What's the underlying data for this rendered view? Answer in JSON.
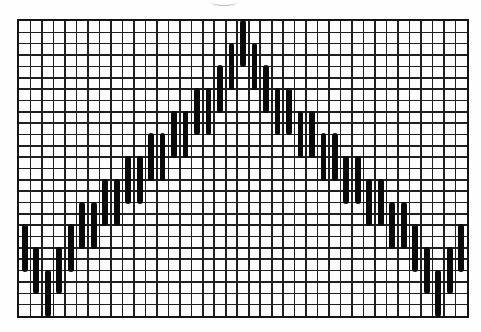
{
  "figure": {
    "name": "bargello-flame-stitch-chart",
    "grid": {
      "columns": 39,
      "rows": 26
    },
    "stitch": {
      "span_rows": 4,
      "step_rows": 2
    },
    "stitches": [
      {
        "col": 1,
        "row": 19
      },
      {
        "col": 2,
        "row": 21
      },
      {
        "col": 3,
        "row": 23
      },
      {
        "col": 4,
        "row": 21
      },
      {
        "col": 5,
        "row": 19
      },
      {
        "col": 6,
        "row": 17
      },
      {
        "col": 7,
        "row": 17
      },
      {
        "col": 8,
        "row": 15
      },
      {
        "col": 9,
        "row": 15
      },
      {
        "col": 10,
        "row": 13
      },
      {
        "col": 11,
        "row": 13
      },
      {
        "col": 12,
        "row": 11
      },
      {
        "col": 13,
        "row": 11
      },
      {
        "col": 14,
        "row": 9
      },
      {
        "col": 15,
        "row": 9
      },
      {
        "col": 16,
        "row": 7
      },
      {
        "col": 17,
        "row": 7
      },
      {
        "col": 18,
        "row": 5
      },
      {
        "col": 19,
        "row": 3
      },
      {
        "col": 20,
        "row": 1
      },
      {
        "col": 21,
        "row": 3
      },
      {
        "col": 22,
        "row": 5
      },
      {
        "col": 23,
        "row": 7
      },
      {
        "col": 24,
        "row": 7
      },
      {
        "col": 25,
        "row": 9
      },
      {
        "col": 26,
        "row": 9
      },
      {
        "col": 27,
        "row": 11
      },
      {
        "col": 28,
        "row": 11
      },
      {
        "col": 29,
        "row": 13
      },
      {
        "col": 30,
        "row": 13
      },
      {
        "col": 31,
        "row": 15
      },
      {
        "col": 32,
        "row": 15
      },
      {
        "col": 33,
        "row": 17
      },
      {
        "col": 34,
        "row": 17
      },
      {
        "col": 35,
        "row": 19
      },
      {
        "col": 36,
        "row": 21
      },
      {
        "col": 37,
        "row": 23
      },
      {
        "col": 38,
        "row": 21
      },
      {
        "col": 39,
        "row": 19
      }
    ],
    "colors": {
      "background": "#fefefe",
      "grid_line": "#1f1f1f",
      "border": "#141414",
      "stitch": "#0a0a0a"
    }
  },
  "chart_data": {
    "type": "bar",
    "title": "",
    "xlabel": "",
    "ylabel": "",
    "x": [
      1,
      2,
      3,
      4,
      5,
      6,
      7,
      8,
      9,
      10,
      11,
      12,
      13,
      14,
      15,
      16,
      17,
      18,
      19,
      20,
      21,
      22,
      23,
      24,
      25,
      26,
      27,
      28,
      29,
      30,
      31,
      32,
      33,
      34,
      35,
      36,
      37,
      38,
      39
    ],
    "series": [
      {
        "name": "stitch_start_row",
        "values": [
          19,
          21,
          23,
          21,
          19,
          17,
          17,
          15,
          15,
          13,
          13,
          11,
          11,
          9,
          9,
          7,
          7,
          5,
          3,
          1,
          3,
          5,
          7,
          7,
          9,
          9,
          11,
          11,
          13,
          13,
          15,
          15,
          17,
          17,
          19,
          21,
          23,
          21,
          19
        ]
      },
      {
        "name": "stitch_end_row",
        "values": [
          22,
          24,
          26,
          24,
          22,
          20,
          20,
          18,
          18,
          16,
          16,
          14,
          14,
          12,
          12,
          10,
          10,
          8,
          6,
          4,
          6,
          8,
          10,
          10,
          12,
          12,
          14,
          14,
          16,
          16,
          18,
          18,
          20,
          20,
          22,
          24,
          26,
          24,
          22
        ]
      }
    ],
    "ylim": [
      1,
      26
    ],
    "grid": true,
    "legend": false
  }
}
